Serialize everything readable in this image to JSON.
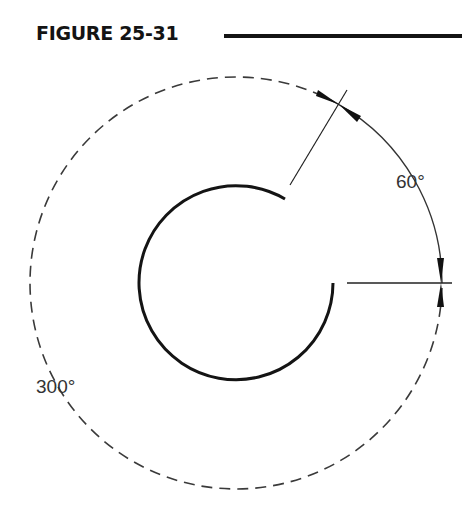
{
  "figure": {
    "title": "FIGURE 25-31"
  },
  "diagram": {
    "labels": {
      "small_angle": "60°",
      "large_angle": "300°"
    },
    "colors": {
      "ink": "#141414",
      "dashed": "#3a3a3a",
      "label": "#333333"
    }
  }
}
